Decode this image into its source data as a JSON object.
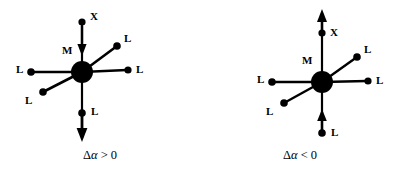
{
  "figure": {
    "background_color": "#ffffff",
    "line_color": "#000000"
  },
  "panels": [
    {
      "id": "left",
      "caption": "Δα > 0",
      "caption_delta": "Δ",
      "caption_alpha": "α",
      "caption_relation": "> 0",
      "center_label": "M",
      "axial_ligand_label": "X",
      "axial_arrow_direction": "down",
      "bottom_ligand_label": "L",
      "bottom_arrow_direction": "down",
      "equatorial_labels": [
        "L",
        "L",
        "L",
        "L"
      ],
      "labels": {
        "center": "M",
        "top_x": "X",
        "upper_right_l": "L",
        "right_l": "L",
        "left_l": "L",
        "lower_left_l": "L",
        "bottom_l": "L"
      }
    },
    {
      "id": "right",
      "caption": "Δα < 0",
      "caption_delta": "Δ",
      "caption_alpha": "α",
      "caption_relation": "< 0",
      "center_label": "M",
      "axial_ligand_label": "X",
      "axial_arrow_direction": "up",
      "bottom_ligand_label": "L",
      "bottom_arrow_direction": "up",
      "equatorial_labels": [
        "L",
        "L",
        "L",
        "L"
      ],
      "labels": {
        "center": "M",
        "top_x": "X",
        "upper_right_l": "L",
        "right_l": "L",
        "left_l": "L",
        "lower_left_l": "L",
        "bottom_l": "L"
      }
    }
  ]
}
